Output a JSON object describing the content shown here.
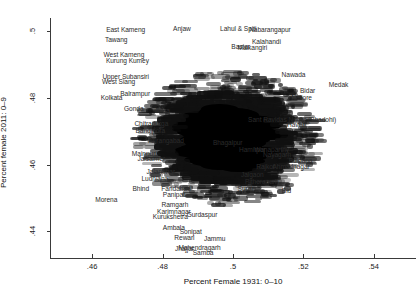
{
  "chart_data": {
    "type": "scatter",
    "title": "",
    "xlabel": "Percent Female 1931: 0–10",
    "ylabel": "Percent female 2011: 0–9",
    "xticks": [
      ".46",
      ".48",
      ".5",
      ".52",
      ".54"
    ],
    "xtick_values": [
      0.46,
      0.48,
      0.5,
      0.52,
      0.54
    ],
    "yticks": [
      ".44",
      ".46",
      ".48",
      ".5"
    ],
    "ytick_values": [
      0.44,
      0.46,
      0.48,
      0.5
    ],
    "xlim": [
      0.448,
      0.552
    ],
    "ylim": [
      0.432,
      0.504
    ],
    "grid": false,
    "legend": false,
    "marker": "text-label",
    "note": "Each observation is plotted as its district name; the central region is heavily overplotted into a solid black mass.",
    "points": [
      {
        "label": "East Kameng",
        "x": 0.4695,
        "y": 0.5005
      },
      {
        "label": "Tawang",
        "x": 0.4668,
        "y": 0.4975
      },
      {
        "label": "Anjaw",
        "x": 0.4855,
        "y": 0.5008
      },
      {
        "label": "Lahul & Spiti",
        "x": 0.5015,
        "y": 0.5007
      },
      {
        "label": "Nabarangapur",
        "x": 0.5105,
        "y": 0.5005
      },
      {
        "label": "Kalahandi",
        "x": 0.5095,
        "y": 0.4968
      },
      {
        "label": "Bastar",
        "x": 0.5022,
        "y": 0.4952
      },
      {
        "label": "Malkangiri",
        "x": 0.5055,
        "y": 0.495
      },
      {
        "label": "West Kameng",
        "x": 0.469,
        "y": 0.4928
      },
      {
        "label": "Kurung Kumey",
        "x": 0.47,
        "y": 0.4912
      },
      {
        "label": "Upper Subansiri",
        "x": 0.4695,
        "y": 0.4862
      },
      {
        "label": "West Siang",
        "x": 0.4675,
        "y": 0.4848
      },
      {
        "label": "Nawada",
        "x": 0.5172,
        "y": 0.487
      },
      {
        "label": "Medak",
        "x": 0.53,
        "y": 0.4838
      },
      {
        "label": "Bidar",
        "x": 0.5212,
        "y": 0.4822
      },
      {
        "label": "Nellore",
        "x": 0.5195,
        "y": 0.48
      },
      {
        "label": "Balrampur",
        "x": 0.4722,
        "y": 0.4812
      },
      {
        "label": "Kolkata",
        "x": 0.4655,
        "y": 0.48
      },
      {
        "label": "Gonda",
        "x": 0.4718,
        "y": 0.4768
      },
      {
        "label": "Sant Ravidas Nagar (Bhadohi)",
        "x": 0.5168,
        "y": 0.4735
      },
      {
        "label": "Haveri",
        "x": 0.518,
        "y": 0.4718
      },
      {
        "label": "Sirsa",
        "x": 0.48,
        "y": 0.4762
      },
      {
        "label": "Chitradurga",
        "x": 0.4768,
        "y": 0.4722
      },
      {
        "label": "Bandipora",
        "x": 0.4765,
        "y": 0.4702
      },
      {
        "label": "Aurangabad",
        "x": 0.481,
        "y": 0.467
      },
      {
        "label": "Bhagalpur",
        "x": 0.4985,
        "y": 0.4665
      },
      {
        "label": "Mainpuri",
        "x": 0.4748,
        "y": 0.4632
      },
      {
        "label": "Jaisalmer",
        "x": 0.4768,
        "y": 0.4618
      },
      {
        "label": "Hamirpur",
        "x": 0.5055,
        "y": 0.4645
      },
      {
        "label": "Wanaparthy",
        "x": 0.511,
        "y": 0.4645
      },
      {
        "label": "Nayagarh",
        "x": 0.5125,
        "y": 0.463
      },
      {
        "label": "Buldana",
        "x": 0.5192,
        "y": 0.4612
      },
      {
        "label": "Ahmadnagar",
        "x": 0.5165,
        "y": 0.4592
      },
      {
        "label": "Rajkot",
        "x": 0.5092,
        "y": 0.4592
      },
      {
        "label": "Jalgaon",
        "x": 0.5055,
        "y": 0.457
      },
      {
        "label": "Jalandhar",
        "x": 0.4795,
        "y": 0.4578
      },
      {
        "label": "Ludhiana",
        "x": 0.4778,
        "y": 0.4558
      },
      {
        "label": "Pithoragarh",
        "x": 0.5082,
        "y": 0.4548
      },
      {
        "label": "Surat",
        "x": 0.5035,
        "y": 0.4528
      },
      {
        "label": "Bid",
        "x": 0.5152,
        "y": 0.4522
      },
      {
        "label": "Bhind",
        "x": 0.4738,
        "y": 0.4528
      },
      {
        "label": "Faridabad",
        "x": 0.4838,
        "y": 0.4528
      },
      {
        "label": "Panipat",
        "x": 0.4832,
        "y": 0.4508
      },
      {
        "label": "Morena",
        "x": 0.464,
        "y": 0.4495
      },
      {
        "label": "Ramgarh",
        "x": 0.4835,
        "y": 0.4478
      },
      {
        "label": "Karimnagar",
        "x": 0.4832,
        "y": 0.4458
      },
      {
        "label": "Gurdaspur",
        "x": 0.4912,
        "y": 0.445
      },
      {
        "label": "Kurukshetra",
        "x": 0.4822,
        "y": 0.4442
      },
      {
        "label": "Ambala",
        "x": 0.4832,
        "y": 0.441
      },
      {
        "label": "Sonipat",
        "x": 0.488,
        "y": 0.4398
      },
      {
        "label": "Rewari",
        "x": 0.4862,
        "y": 0.438
      },
      {
        "label": "Jammu",
        "x": 0.4948,
        "y": 0.4378
      },
      {
        "label": "Mahendragarh",
        "x": 0.4905,
        "y": 0.435
      },
      {
        "label": "Jhajjar",
        "x": 0.4862,
        "y": 0.4348
      },
      {
        "label": "Samba",
        "x": 0.4915,
        "y": 0.4335
      }
    ]
  },
  "axes": {
    "x_title": "Percent Female 1931: 0–10",
    "y_title": "Percent female 2011: 0–9"
  },
  "labels": {
    "east_kameng": "East Kameng",
    "tawang": "Tawang",
    "anjaw": "Anjaw",
    "lahul_spiti": "Lahul & Spiti",
    "nabarangapur": "Nabarangapur",
    "kalahandi": "Kalahandi",
    "bastar": "Bastar",
    "malkangiri": "Malkangiri",
    "west_kameng": "West Kameng",
    "kurung_kumey": "Kurung Kumey",
    "upper_subansiri": "Upper Subansiri",
    "west_siang": "West Siang",
    "nawada": "Nawada",
    "medak": "Medak",
    "bidar": "Bidar",
    "nellore": "Nellore",
    "balrampur": "Balrampur",
    "kolkata": "Kolkata",
    "gonda": "Gonda",
    "bhadohi": "Sant Ravidas Nagar (Bhadohi)",
    "haveri": "Haveri",
    "sirsa": "Sirsa",
    "chitradurga": "Chitradurga",
    "bandipora": "Bandipora",
    "aurangabad": "Aurangabad",
    "bhagalpur": "Bhagalpur",
    "mainpuri": "Mainpuri",
    "jaisalmer": "Jaisalmer",
    "hamirpur": "Hamirpur",
    "wanaparthy": "Wanaparthy",
    "nayagarh": "Nayagarh",
    "buldana": "Buldana",
    "ahmadnagar": "Ahmadnagar",
    "rajkot": "Rajkot",
    "jalgaon": "Jalgaon",
    "jalandhar": "Jalandhar",
    "ludhiana": "Ludhiana",
    "pithoragarh": "Pithoragarh",
    "surat": "Surat",
    "bid": "Bid",
    "bhind": "Bhind",
    "faridabad": "Faridabad",
    "panipat": "Panipat",
    "morena": "Morena",
    "ramgarh": "Ramgarh",
    "karimnagar": "Karimnagar",
    "gurdaspur": "Gurdaspur",
    "kurukshetra": "Kurukshetra",
    "ambala": "Ambala",
    "sonipat": "Sonipat",
    "rewari": "Rewari",
    "jammu": "Jammu",
    "mahendragarh": "Mahendragarh",
    "jhajjar": "Jhajjar",
    "samba": "Samba"
  }
}
